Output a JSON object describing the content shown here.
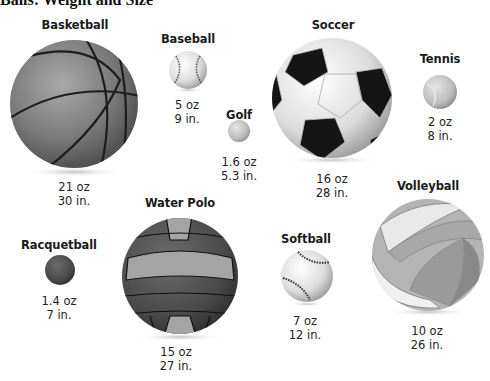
{
  "header": {
    "clipped_title": "Balls: Weight and Size"
  },
  "balls": [
    {
      "name": "Basketball",
      "weight": "21 oz",
      "size": "30 in."
    },
    {
      "name": "Baseball",
      "weight": "5 oz",
      "size": "9 in."
    },
    {
      "name": "Golf",
      "weight": "1.6 oz",
      "size": "5.3 in."
    },
    {
      "name": "Soccer",
      "weight": "16 oz",
      "size": "28 in."
    },
    {
      "name": "Tennis",
      "weight": "2 oz",
      "size": "8 in."
    },
    {
      "name": "Racquetball",
      "weight": "1.4 oz",
      "size": "7 in."
    },
    {
      "name": "Water Polo",
      "weight": "15 oz",
      "size": "27 in."
    },
    {
      "name": "Softball",
      "weight": "7 oz",
      "size": "12 in."
    },
    {
      "name": "Volleyball",
      "weight": "10 oz",
      "size": "26 in."
    }
  ]
}
